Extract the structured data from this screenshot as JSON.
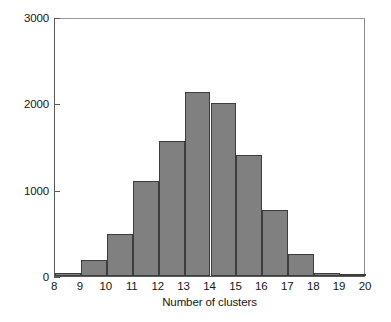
{
  "chart_data": {
    "type": "bar",
    "title": "",
    "subtitle": "",
    "xlabel": "Number of clusters",
    "ylabel": "",
    "xlim": [
      8,
      20
    ],
    "ylim": [
      0,
      3000
    ],
    "grid": false,
    "legend": null,
    "bin_edges": [
      8,
      9,
      10,
      11,
      12,
      13,
      14,
      15,
      16,
      17,
      18,
      19,
      20
    ],
    "categories": [
      "8-9",
      "9-10",
      "10-11",
      "11-12",
      "12-13",
      "13-14",
      "14-15",
      "15-16",
      "16-17",
      "17-18",
      "18-19",
      "19-20"
    ],
    "values": [
      30,
      180,
      490,
      1100,
      1560,
      2130,
      2000,
      1400,
      770,
      250,
      40,
      10
    ],
    "xticks": [
      "8",
      "9",
      "10",
      "11",
      "12",
      "13",
      "14",
      "15",
      "16",
      "17",
      "18",
      "19",
      "20"
    ],
    "xtick_values": [
      8,
      9,
      10,
      11,
      12,
      13,
      14,
      15,
      16,
      17,
      18,
      19,
      20
    ],
    "yticks": [
      "0",
      "1000",
      "2000",
      "3000"
    ],
    "ytick_values": [
      0,
      1000,
      2000,
      3000
    ],
    "bar_color": "#808080",
    "bar_edge_color": "#3d3d3d",
    "axis_color": "#5a5a5a",
    "text_color": "#161616",
    "background_color": "#ffffff"
  }
}
